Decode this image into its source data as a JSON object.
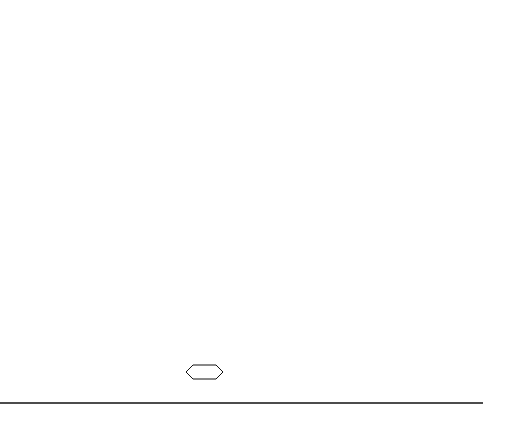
{
  "figure": {
    "grid": {
      "columns": 3,
      "rows": 6
    },
    "contour_levels": {
      "count": 17,
      "outermost_style": "dashed",
      "peak_label": "15"
    },
    "labels": {
      "peak": "15"
    }
  }
}
